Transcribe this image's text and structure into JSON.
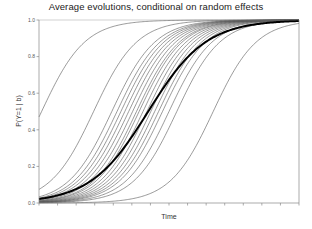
{
  "chart_data": {
    "type": "line",
    "title": "Average evolutions, conditional on random effects",
    "xlabel": "Time",
    "ylabel": "P(Y=1 | b)",
    "ylim": [
      0.0,
      1.0
    ],
    "yticks": [
      "0.0",
      "0.2",
      "0.4",
      "0.6",
      "0.8",
      "1.0"
    ],
    "xticks_count": 15,
    "xticks_labeled": false,
    "grid": false,
    "legend": null,
    "xlim": [
      0,
      1
    ],
    "series": [
      {
        "name": "subject-1",
        "midpoint": 0.01,
        "slope": 12.0,
        "weight": "thin"
      },
      {
        "name": "subject-2",
        "midpoint": 0.21,
        "slope": 12.0,
        "weight": "thin"
      },
      {
        "name": "subject-3",
        "midpoint": 0.28,
        "slope": 12.0,
        "weight": "thin"
      },
      {
        "name": "subject-4",
        "midpoint": 0.3,
        "slope": 12.0,
        "weight": "thin"
      },
      {
        "name": "subject-5",
        "midpoint": 0.315,
        "slope": 12.0,
        "weight": "thin"
      },
      {
        "name": "subject-6",
        "midpoint": 0.33,
        "slope": 12.0,
        "weight": "thin"
      },
      {
        "name": "subject-7",
        "midpoint": 0.345,
        "slope": 12.0,
        "weight": "thin"
      },
      {
        "name": "subject-8",
        "midpoint": 0.36,
        "slope": 12.0,
        "weight": "thin"
      },
      {
        "name": "subject-9",
        "midpoint": 0.375,
        "slope": 12.0,
        "weight": "thin"
      },
      {
        "name": "subject-10",
        "midpoint": 0.385,
        "slope": 12.0,
        "weight": "thin"
      },
      {
        "name": "subject-11",
        "midpoint": 0.4,
        "slope": 12.0,
        "weight": "thin"
      },
      {
        "name": "subject-12",
        "midpoint": 0.415,
        "slope": 12.0,
        "weight": "thin"
      },
      {
        "name": "subject-13",
        "midpoint": 0.43,
        "slope": 12.0,
        "weight": "thin"
      },
      {
        "name": "subject-14",
        "midpoint": 0.445,
        "slope": 12.0,
        "weight": "thin"
      },
      {
        "name": "subject-15",
        "midpoint": 0.46,
        "slope": 12.0,
        "weight": "thin"
      },
      {
        "name": "subject-16",
        "midpoint": 0.475,
        "slope": 12.0,
        "weight": "thin"
      },
      {
        "name": "subject-17",
        "midpoint": 0.5,
        "slope": 12.0,
        "weight": "thin"
      },
      {
        "name": "subject-18",
        "midpoint": 0.53,
        "slope": 12.0,
        "weight": "thin"
      },
      {
        "name": "subject-19",
        "midpoint": 0.67,
        "slope": 12.0,
        "weight": "thin"
      },
      {
        "name": "average",
        "midpoint": 0.42,
        "slope": 9.0,
        "weight": "thick"
      }
    ]
  },
  "layout": {
    "plot_left": 39,
    "plot_right": 299,
    "plot_top": 20,
    "plot_bottom": 203,
    "line_color": "#555555",
    "thick_color": "#000000",
    "axis_color": "#888888"
  }
}
